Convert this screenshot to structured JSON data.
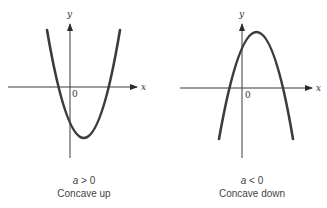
{
  "figure": {
    "panels": [
      {
        "id": "concave-up",
        "axis_x_label": "x",
        "axis_y_label": "y",
        "origin_label": "0",
        "condition_var": "a",
        "condition_op": ">",
        "condition_val": "0",
        "caption": "Concave up"
      },
      {
        "id": "concave-down",
        "axis_x_label": "x",
        "axis_y_label": "y",
        "origin_label": "0",
        "condition_var": "a",
        "condition_op": "<",
        "condition_val": "0",
        "caption": "Concave down"
      }
    ]
  }
}
